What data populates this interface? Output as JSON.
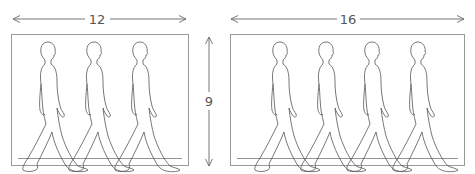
{
  "diagram": {
    "frames": [
      {
        "id": "frame-12x9",
        "width_label": "12",
        "figure_count": 3
      },
      {
        "id": "frame-16x9",
        "width_label": "16",
        "figure_count": 4
      }
    ],
    "height_label": "9",
    "colors": {
      "line": "#666666",
      "frame": "#999999",
      "figure": "#555555"
    }
  }
}
